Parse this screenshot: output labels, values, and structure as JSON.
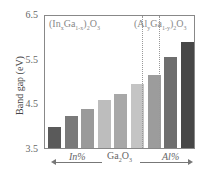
{
  "chart_data": {
    "type": "bar",
    "title": "",
    "xlabel": "",
    "ylabel": "Band gap (eV)",
    "ylim": [
      3.5,
      6.5
    ],
    "yticks": [
      "6.5",
      "5.5",
      "4.5",
      "3.5"
    ],
    "grid": false,
    "categories": [
      "In-4",
      "In-3",
      "In-2",
      "In-1",
      "Ga2O3",
      "Al-1",
      "Al-2",
      "Al-3",
      "Al-4"
    ],
    "values": [
      3.98,
      4.22,
      4.38,
      4.6,
      4.73,
      4.95,
      5.15,
      5.56,
      5.92
    ],
    "bar_colors": [
      "#5a5a5a",
      "#7a7a7a",
      "#9a9a9a",
      "#bdbdbd",
      "#a8a8a8",
      "#c4c4c4",
      "#9c9c9c",
      "#6e6e6e",
      "#474747"
    ],
    "annotations": {
      "left_region": "(InxGa1-x)2O3",
      "right_region": "(AlyGa1-y)2O3",
      "bottom_left": "In%",
      "bottom_center": "Ga2O3",
      "bottom_right": "Al%"
    }
  },
  "labels": {
    "ylabel": "Band gap (eV)",
    "ytick_65": "6.5",
    "ytick_55": "5.5",
    "ytick_45": "4.5",
    "ytick_35": "3.5",
    "left_region_base1": "(In",
    "left_region_sub1": "x",
    "left_region_base2": "Ga",
    "left_region_sub2": "1-x",
    "left_region_base3": ")",
    "left_region_sub3": "2",
    "left_region_base4": "O",
    "left_region_sub4": "3",
    "right_region_base1": "(Al",
    "right_region_sub1": "y",
    "right_region_base2": "Ga",
    "right_region_sub2": "1-y",
    "right_region_base3": ")",
    "right_region_sub3": "2",
    "right_region_base4": "O",
    "right_region_sub4": "3",
    "bottom_left": "In%",
    "bottom_center_base1": "Ga",
    "bottom_center_sub1": "2",
    "bottom_center_base2": "O",
    "bottom_center_sub2": "3",
    "bottom_right": "Al%"
  }
}
